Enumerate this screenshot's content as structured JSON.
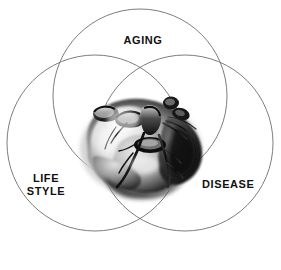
{
  "figure": {
    "type": "venn-diagram",
    "set_count": 3,
    "center_image": "anatomical-heart-illustration",
    "background_color": "#ffffff",
    "circle_stroke_color": "#6e6e72",
    "label_color": "#111111"
  },
  "labels": {
    "aging": "AGING",
    "lifestyle": "LIFE\nSTYLE",
    "disease": "DISEASE"
  },
  "circles": [
    {
      "name": "aging",
      "label": "AGING",
      "cx": 140,
      "cy": 96,
      "r": 87
    },
    {
      "name": "lifestyle",
      "label": "LIFE STYLE",
      "cx": 95,
      "cy": 143,
      "r": 88
    },
    {
      "name": "disease",
      "label": "DISEASE",
      "cx": 185,
      "cy": 143,
      "r": 88
    }
  ]
}
